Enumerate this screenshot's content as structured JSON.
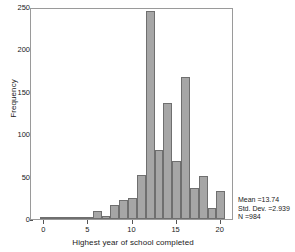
{
  "chart_data": {
    "type": "bar",
    "title": "",
    "subtitle": "",
    "xlabel": "Highest year of school completed",
    "ylabel": "Frequency",
    "xlim": [
      -1.5,
      21.5
    ],
    "ylim": [
      0,
      250
    ],
    "grid": false,
    "legend": null,
    "bar_color": "#a6a6a6",
    "bar_edge_color": "#6f6f6f",
    "xticks": [
      0,
      5,
      10,
      15,
      20
    ],
    "xtick_labels": [
      "0",
      "5",
      "10",
      "15",
      "20"
    ],
    "yticks": [
      0,
      50,
      100,
      150,
      200,
      250
    ],
    "ytick_labels": [
      "0",
      "50",
      "100",
      "150",
      "200",
      "250"
    ],
    "bin_width": 1,
    "categories": [
      0,
      1,
      2,
      3,
      4,
      5,
      6,
      7,
      8,
      9,
      10,
      11,
      12,
      13,
      14,
      15,
      16,
      17,
      18,
      19,
      20
    ],
    "values": [
      1,
      2,
      1,
      1,
      1,
      2,
      9,
      3,
      17,
      23,
      25,
      52,
      245,
      81,
      137,
      68,
      168,
      37,
      51,
      13,
      33
    ],
    "annotations": [
      "Mean =13.74",
      "Std. Dev. =2.939",
      "N =984"
    ]
  },
  "stats": {
    "mean": "Mean =13.74",
    "std_dev": "Std. Dev. =2.939",
    "n": "N =984"
  }
}
